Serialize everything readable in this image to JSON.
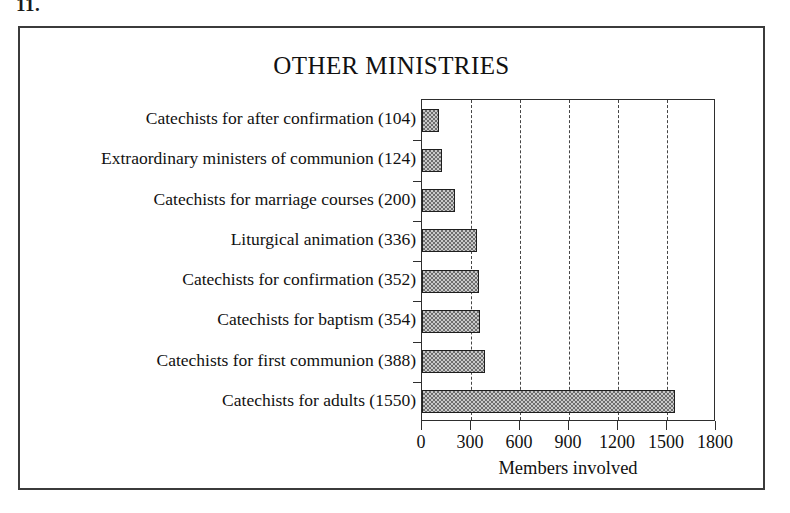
{
  "figure": {
    "caption": "11.",
    "title": "OTHER MINISTRIES"
  },
  "chart_data": {
    "type": "bar",
    "orientation": "horizontal",
    "title": "OTHER MINISTRIES",
    "xlabel": "Members involved",
    "ylabel": "",
    "xlim": [
      0,
      1800
    ],
    "xticks": [
      0,
      300,
      600,
      900,
      1200,
      1500,
      1800
    ],
    "xtick_labels": [
      "0",
      "300",
      "600",
      "900",
      "1200",
      "1500",
      "1800"
    ],
    "grid": "vertical-dashed",
    "legend": "none",
    "bar_fill": "#c9c9c9",
    "bar_pattern": "checkerboard-hatch",
    "bar_edge_color": "#1e1e1e",
    "categories": [
      "Catechists for after confirmation (104)",
      "Extraordinary ministers of communion (124)",
      "Catechists for marriage courses (200)",
      "Liturgical animation (336)",
      "Catechists for confirmation (352)",
      "Catechists for baptism (354)",
      "Catechists for first communion (388)",
      "Catechists for adults (1550)"
    ],
    "values": [
      104,
      124,
      200,
      336,
      352,
      354,
      388,
      1550
    ],
    "points": [
      {
        "label": "Catechists for after confirmation (104)",
        "value": 104
      },
      {
        "label": "Extraordinary ministers of communion (124)",
        "value": 124
      },
      {
        "label": "Catechists for marriage courses (200)",
        "value": 200
      },
      {
        "label": "Liturgical animation (336)",
        "value": 336
      },
      {
        "label": "Catechists for confirmation (352)",
        "value": 352
      },
      {
        "label": "Catechists for baptism (354)",
        "value": 354
      },
      {
        "label": "Catechists for first communion (388)",
        "value": 388
      },
      {
        "label": "Catechists for adults (1550)",
        "value": 1550
      }
    ]
  }
}
